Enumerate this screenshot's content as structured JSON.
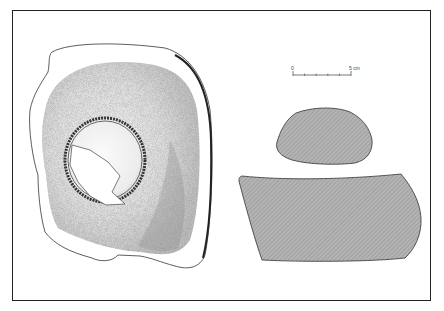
{
  "figure": {
    "type": "archaeological-artifact-drawing",
    "views": [
      {
        "name": "plan-view",
        "description": "stippled plan view of stone with circular depression"
      },
      {
        "name": "section-small",
        "description": "hatched cross-section (upper)"
      },
      {
        "name": "section-large",
        "description": "hatched cross-section (lower)"
      }
    ]
  },
  "scale_bar": {
    "start_label": "0",
    "end_label": "5 cm",
    "divisions": 5
  },
  "colors": {
    "frame": "#222222",
    "outline": "#333333",
    "section_fill": "#a9a9a9",
    "stipple_light": "#d9d9d9",
    "stipple_dark": "#8a8a8a",
    "background": "#ffffff"
  }
}
